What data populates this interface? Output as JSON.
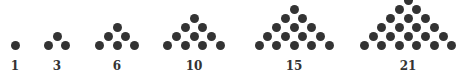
{
  "colors": {
    "dot": "#333333",
    "label": "#333333",
    "background": "#ffffff"
  },
  "layout": {
    "baseline_y": 45,
    "row_step_y": 9,
    "dot_step_x": 17.5,
    "dot_diameter": 9
  },
  "figures": [
    {
      "label": "1",
      "rows": 1,
      "center_x": 15
    },
    {
      "label": "3",
      "rows": 2,
      "center_x": 57
    },
    {
      "label": "6",
      "rows": 3,
      "center_x": 117
    },
    {
      "label": "10",
      "rows": 4,
      "center_x": 194
    },
    {
      "label": "15",
      "rows": 5,
      "center_x": 294
    },
    {
      "label": "21",
      "rows": 6,
      "center_x": 408
    }
  ]
}
